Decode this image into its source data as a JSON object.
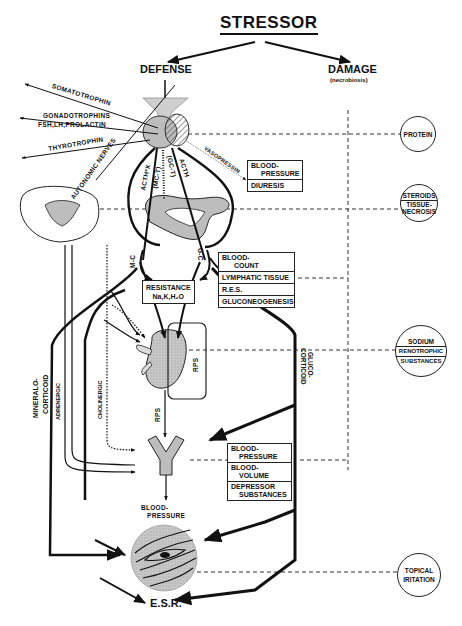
{
  "diagram": {
    "title": "STRESSOR",
    "branches": {
      "defense": "DEFENSE",
      "damage": "DAMAGE",
      "damage_sub": "(necrobiosis)"
    },
    "pituitary_outputs": [
      {
        "label": "SOMATOTROPHIN"
      },
      {
        "label": "GONADOTROPHINS"
      },
      {
        "label": "FSH,LH,PROLACTIN"
      },
      {
        "label": "THYROTROPHIN"
      }
    ],
    "pathways": {
      "autonomic_nerves": "AUTONOMIC NERVES",
      "acth_x": "ACTH*X",
      "mc_t": "(MC-T)",
      "acth": "ACTH",
      "gc_t": "(GC-T)",
      "vasopressin": "VASOPRESSIN",
      "m_c": "M-C",
      "g_c": "G-C",
      "rps_kidney": "RPS",
      "rps_vessel": "RPS",
      "mineralocorticoid_1": "MINERALO-",
      "mineralocorticoid_2": "CORTICOID",
      "adrenergic": "ADRENERGIC",
      "cholinergic": "CHOLINERGIC",
      "glucocorticoid_1": "GLUCO-",
      "glucocorticoid_2": "CORTICOID"
    },
    "boxes": {
      "vasopressin_effects": [
        "BLOOD-",
        "PRESSURE",
        "DIURESIS"
      ],
      "gc_effects": [
        "BLOOD-",
        "COUNT",
        "LYMPHATIC TISSUE",
        "R.E.S.",
        "GLUCONEOGENESIS"
      ],
      "resistance": [
        "RESISTANCE",
        "Na,K,H₂O"
      ],
      "vessel_effects": [
        "BLOOD-",
        "PRESSURE",
        "BLOOD-",
        "VOLUME",
        "DEPRESSOR",
        "SUBSTANCES"
      ]
    },
    "damage_circles": {
      "protein": [
        "PROTEIN"
      ],
      "steroids": [
        "STEROIDS",
        "TISSUE-",
        "NECROSIS"
      ],
      "sodium": [
        "SODIUM",
        "RENOTROPHIC",
        "SUBSTANCES"
      ],
      "topical": [
        "TOPICAL",
        "IRITATION"
      ]
    },
    "outputs": {
      "blood_pressure_1": "BLOOD-",
      "blood_pressure_2": "PRESSURE",
      "esr": "E.S.R."
    },
    "colors": {
      "ink": "#111111",
      "organ_fill": "#bdbdbd",
      "background": "#ffffff"
    }
  }
}
